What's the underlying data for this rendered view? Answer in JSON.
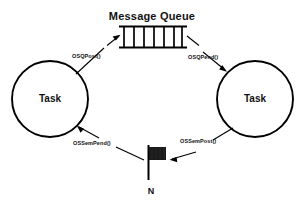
{
  "diagram": {
    "title": "Message Queue",
    "background_color": "#ffffff",
    "stroke_color": "#000000",
    "fill_color": "#1a1a1a",
    "nodes": {
      "message_queue": {
        "label": "Message Queue",
        "icon": "queue-icon",
        "cells": 6,
        "x": 122,
        "y": 26,
        "width": 62,
        "height": 22
      },
      "task_left": {
        "label": "Task",
        "icon": "circle-icon",
        "cx": 50,
        "cy": 99,
        "r": 38
      },
      "task_right": {
        "label": "Task",
        "icon": "circle-icon",
        "cx": 255,
        "cy": 99,
        "r": 38
      },
      "semaphore": {
        "label": "N",
        "icon": "flag-icon",
        "x": 150,
        "y": 148,
        "width": 16,
        "height": 13
      }
    },
    "edges": [
      {
        "name": "task-left-to-queue",
        "label": "OSQPost()",
        "from": "task_left",
        "to": "message_queue",
        "direction": "up-right"
      },
      {
        "name": "queue-to-task-right",
        "label": "OSQPend()",
        "from": "message_queue",
        "to": "task_right",
        "direction": "down-right"
      },
      {
        "name": "task-right-to-semaphore",
        "label": "OSSemPost()",
        "from": "task_right",
        "to": "semaphore",
        "direction": "down-left"
      },
      {
        "name": "semaphore-to-task-left",
        "label": "OSSemPend()",
        "from": "semaphore",
        "to": "task_left",
        "direction": "up-left"
      }
    ]
  }
}
